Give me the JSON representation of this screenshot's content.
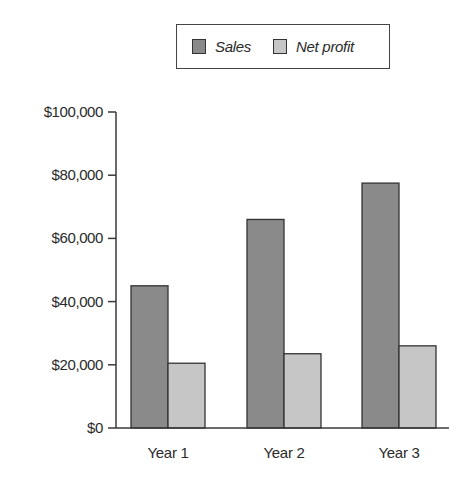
{
  "chart_data": {
    "type": "bar",
    "title": "",
    "xlabel": "",
    "ylabel": "",
    "categories": [
      "Year 1",
      "Year 2",
      "Year 3"
    ],
    "series": [
      {
        "name": "Sales",
        "color": "#8a8a8a",
        "values": [
          45000,
          66000,
          77500
        ]
      },
      {
        "name": "Net profit",
        "color": "#c6c6c6",
        "values": [
          20500,
          23500,
          26000
        ]
      }
    ],
    "ylim": [
      0,
      100000
    ],
    "yticks": [
      0,
      20000,
      40000,
      60000,
      80000,
      100000
    ],
    "ytick_labels": [
      "$0",
      "$20,000",
      "$40,000",
      "$60,000",
      "$80,000",
      "$100,000"
    ],
    "grid": false,
    "legend_position": "top"
  },
  "legend": {
    "items": [
      {
        "label": "Sales",
        "color": "#8a8a8a"
      },
      {
        "label": "Net profit",
        "color": "#c6c6c6"
      }
    ]
  },
  "colors": {
    "axis": "#3a3a3a",
    "bar_outline": "#333333",
    "text": "#2a2a2a"
  }
}
